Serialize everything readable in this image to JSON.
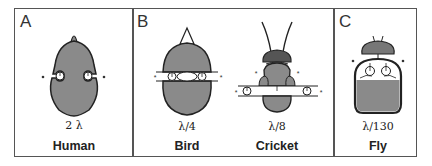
{
  "panels": [
    {
      "letter": "A",
      "animals": [
        {
          "name": "Human",
          "ratio": "2 λ"
        }
      ]
    },
    {
      "letter": "B",
      "animals": [
        {
          "name": "Bird",
          "ratio": "λ/4"
        },
        {
          "name": "Cricket",
          "ratio": "λ/8"
        }
      ]
    },
    {
      "letter": "C",
      "animals": [
        {
          "name": "Fly",
          "ratio": "λ/130"
        }
      ]
    }
  ],
  "colors": {
    "fill": "#8a8a8a",
    "outline": "#222222",
    "dark": "#555555",
    "border": "#555555"
  }
}
